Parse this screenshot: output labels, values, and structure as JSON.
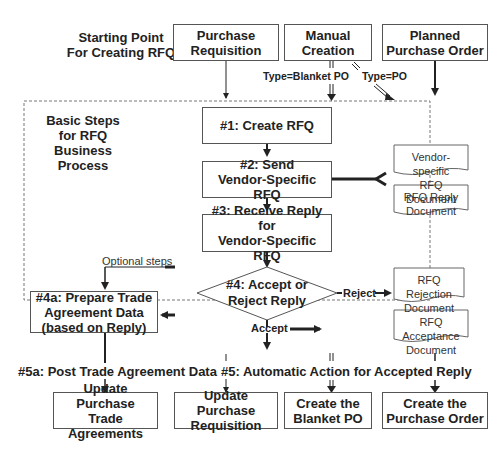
{
  "header": {
    "starting_point_label": "Starting Point\nFor Creating RFQ",
    "sources": [
      {
        "id": "purchase-requisition",
        "label": "Purchase\nRequisition"
      },
      {
        "id": "manual-creation",
        "label": "Manual\nCreation"
      },
      {
        "id": "planned-purchase-order",
        "label": "Planned\nPurchase Order"
      }
    ],
    "edge_labels": {
      "blanket": "Type=Blanket PO",
      "po": "Type=PO"
    }
  },
  "process": {
    "title": "Basic Steps\nfor RFQ\nBusiness Process",
    "steps": [
      {
        "id": "step1",
        "label": "#1: Create RFQ"
      },
      {
        "id": "step2",
        "label": "#2: Send\nVendor-Specific RFQ"
      },
      {
        "id": "step3",
        "label": "#3: Receive Reply for\nVendor-Specific RFQ"
      },
      {
        "id": "step4",
        "label": "#4: Accept or\nReject Reply"
      },
      {
        "id": "step4a",
        "label": "#4a: Prepare Trade\nAgreement Data\n(based on Reply)"
      }
    ],
    "documents": [
      {
        "id": "vendor-specific-rfq-doc",
        "label": "Vendor-specific\nRFQ Document"
      },
      {
        "id": "rfq-reply-doc",
        "label": "RFQ Reply\nDocument"
      },
      {
        "id": "rfq-rejection-doc",
        "label": "RFQ Rejection\nDocument"
      },
      {
        "id": "rfq-acceptance-doc",
        "label": "RFQ Acceptance\nDocument"
      }
    ],
    "edge_labels": {
      "optional": "Optional steps",
      "reject": "Reject",
      "accept": "Accept"
    }
  },
  "outcomes": {
    "step5a_label": "#5a: Post Trade Agreement Data",
    "step5_label": "#5: Automatic Action for Accepted Reply",
    "targets": [
      {
        "id": "update-trade-agreements",
        "label": "Update Purchase\nTrade Agreements"
      },
      {
        "id": "update-purchase-requisition",
        "label": "Update Purchase\nRequisition"
      },
      {
        "id": "create-blanket-po",
        "label": "Create the\nBlanket PO"
      },
      {
        "id": "create-purchase-order",
        "label": "Create the\nPurchase Order"
      }
    ]
  },
  "colors": {
    "line": "#222222",
    "border": "#555555",
    "dashed": "#777777"
  }
}
